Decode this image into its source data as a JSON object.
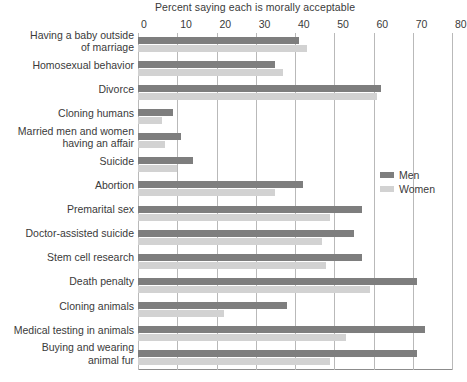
{
  "chart_data": {
    "type": "bar",
    "orientation": "horizontal",
    "title": "Percent saying each is morally acceptable",
    "xlabel": "",
    "ylabel": "",
    "xlim": [
      0,
      80
    ],
    "xticks": [
      0,
      10,
      20,
      30,
      40,
      50,
      60,
      70,
      80
    ],
    "grid": true,
    "legend_position": "middle-right",
    "categories": [
      "Having a baby outside\nof marriage",
      "Homosexual behavior",
      "Divorce",
      "Cloning humans",
      "Married men and women\nhaving an affair",
      "Suicide",
      "Abortion",
      "Premarital sex",
      "Doctor-assisted suicide",
      "Stem cell research",
      "Death penalty",
      "Cloning animals",
      "Medical testing in animals",
      "Buying and wearing\nanimal fur"
    ],
    "series": [
      {
        "name": "Men",
        "color": "#7e7e7e",
        "values": [
          41,
          35,
          62,
          9,
          11,
          14,
          42,
          57,
          55,
          57,
          71,
          38,
          73,
          71
        ]
      },
      {
        "name": "Women",
        "color": "#d2d2d2",
        "values": [
          43,
          37,
          61,
          6,
          7,
          10,
          35,
          49,
          47,
          48,
          59,
          22,
          53,
          49
        ]
      }
    ]
  },
  "legend": {
    "items": [
      {
        "label": "Men"
      },
      {
        "label": "Women"
      }
    ]
  }
}
